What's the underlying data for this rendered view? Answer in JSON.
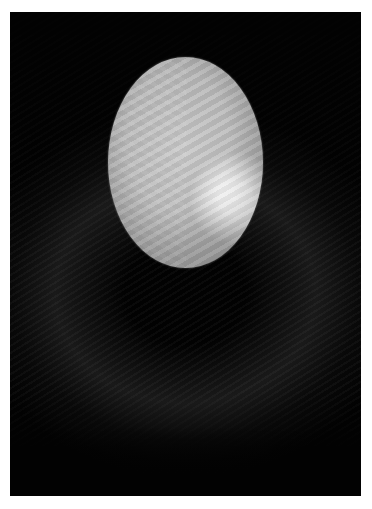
{
  "image": {
    "description": "Black-and-white photograph of a glowing oval (egg-like) light form floating above a dark background with faint wavy diagonal textures, framed by a thin white border",
    "colors": {
      "border": "#ffffff",
      "background": "#020202",
      "oval_base": "#bfbfbf",
      "oval_highlight": "#ffffff"
    },
    "elements": [
      {
        "name": "white-border",
        "label": "White photo border"
      },
      {
        "name": "glowing-oval",
        "label": "Glowing oval light shape"
      },
      {
        "name": "dark-wavy-background",
        "label": "Dark background with faint wave pattern"
      }
    ]
  }
}
